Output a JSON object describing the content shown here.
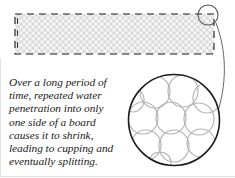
{
  "figure": {
    "background_color": "#ffffff",
    "width": 235,
    "height": 178
  },
  "caption": {
    "full_text": "Over a long period of time, repeated water penetration into only one side of a board causes it to shrink, leading to cupping and eventually splitting.",
    "lines": [
      "Over a long period of",
      "time, repeated water",
      "penetration into only",
      "one side of a board",
      "causes it to shrink,",
      "leading to cupping and",
      "eventually splitting."
    ],
    "style": "italic-serif",
    "color": "#1a1a1a"
  },
  "board": {
    "label": "board-cross-section",
    "outline_style": "dashed",
    "outline_color": "#1a1a1a",
    "fill_texture": "cell-grid",
    "texture_color": "#c9c9c9",
    "fill_color": "#f7f7f7",
    "x": 15,
    "y": 14,
    "width": 199,
    "height": 40
  },
  "callout_circle": {
    "label": "magnification-source-marker",
    "stroke_color": "#555555",
    "cx": 208,
    "cy": 15,
    "r": 10
  },
  "leader_line": {
    "label": "magnification-leader",
    "stroke_color": "#555555"
  },
  "magnifier": {
    "label": "magnified-cell-view",
    "stroke_color": "#1a1a1a",
    "cx": 174,
    "cy": 120,
    "r": 46,
    "cell_stroke_color": "#b0b0b0",
    "cell_count": 11,
    "cells": [
      {
        "cx": 155,
        "cy": 92,
        "rx": 15,
        "ry": 16
      },
      {
        "cx": 183,
        "cy": 91,
        "rx": 15,
        "ry": 16
      },
      {
        "cx": 207,
        "cy": 98,
        "rx": 14,
        "ry": 15
      },
      {
        "cx": 143,
        "cy": 118,
        "rx": 15,
        "ry": 16
      },
      {
        "cx": 171,
        "cy": 118,
        "rx": 15,
        "ry": 16
      },
      {
        "cx": 199,
        "cy": 119,
        "rx": 15,
        "ry": 16
      },
      {
        "cx": 146,
        "cy": 145,
        "rx": 15,
        "ry": 15
      },
      {
        "cx": 174,
        "cy": 146,
        "rx": 15,
        "ry": 16
      },
      {
        "cx": 201,
        "cy": 143,
        "rx": 14,
        "ry": 14
      },
      {
        "cx": 133,
        "cy": 100,
        "rx": 11,
        "ry": 12
      },
      {
        "cx": 160,
        "cy": 162,
        "rx": 11,
        "ry": 10
      }
    ]
  },
  "frame": {
    "label": "figure-border",
    "color": "#d8d8d8"
  }
}
